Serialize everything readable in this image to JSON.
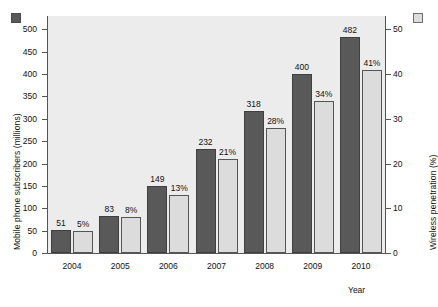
{
  "chart_data": {
    "type": "bar",
    "title": "",
    "xlabel": "Year",
    "categories": [
      "2004",
      "2005",
      "2006",
      "2007",
      "2008",
      "2009",
      "2010"
    ],
    "series": [
      {
        "name": "Mobile phone subscribers (millions)",
        "axis": "left",
        "color": "#595959",
        "values": [
          51,
          83,
          149,
          232,
          318,
          400,
          482
        ],
        "labels": [
          "51",
          "83",
          "149",
          "232",
          "318",
          "400",
          "482"
        ]
      },
      {
        "name": "Wireless penetration (%)",
        "axis": "right",
        "color": "#dcdcdc",
        "values": [
          5,
          8,
          13,
          21,
          28,
          34,
          41
        ],
        "labels": [
          "5%",
          "8%",
          "13%",
          "21%",
          "28%",
          "34%",
          "41%"
        ]
      }
    ],
    "left_axis": {
      "label": "Mobile phone subscribers (millions)",
      "ticks": [
        "0",
        "50",
        "100",
        "150",
        "200",
        "250",
        "300",
        "350",
        "400",
        "450",
        "500"
      ],
      "min": 0,
      "max": 530
    },
    "right_axis": {
      "label": "Wireless penetration (%)",
      "ticks": [
        "0",
        "10",
        "20",
        "30",
        "40",
        "50"
      ],
      "min": 0,
      "max": 53
    },
    "grid": false,
    "legend_position": "axis-titles",
    "plot_background": "#ececec"
  }
}
